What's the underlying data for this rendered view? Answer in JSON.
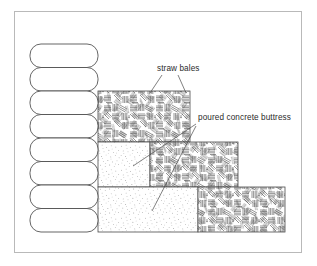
{
  "diagram": {
    "background_color": "#ffffff",
    "frame": {
      "border_color": "#b9b9b9",
      "x": 14,
      "y": 11,
      "width": 288,
      "height": 242
    },
    "labels": [
      {
        "id": "straw-bales",
        "text": "straw bales",
        "x": 157,
        "y": 64,
        "leaders": [
          {
            "x1": 162,
            "y1": 75,
            "x2": 150,
            "y2": 92
          },
          {
            "x1": 178,
            "y1": 75,
            "x2": 186,
            "y2": 92
          }
        ]
      },
      {
        "id": "poured-concrete-buttress",
        "text": "poured concrete buttress",
        "x": 198,
        "y": 113,
        "leaders": [
          {
            "x1": 196,
            "y1": 124,
            "x2": 133,
            "y2": 165
          },
          {
            "x1": 196,
            "y1": 126,
            "x2": 152,
            "y2": 210
          }
        ]
      }
    ],
    "bale_stack": {
      "name": "straw bale wall",
      "count": 8,
      "x": 30,
      "y": 44,
      "width": 68,
      "bale_height": 23.5,
      "corner_radius": 11,
      "stroke_color": "#4a4a4a",
      "fill_color": "#ffffff"
    },
    "buttress_steps": [
      {
        "id": "step-top",
        "material": "straw",
        "texture": "straw-hatch",
        "x": 98,
        "y": 91,
        "width": 92,
        "height": 51
      },
      {
        "id": "step-middle-concrete",
        "material": "concrete",
        "texture": "concrete-stipple",
        "x": 98,
        "y": 142,
        "width": 52,
        "height": 45
      },
      {
        "id": "step-middle-straw",
        "material": "straw",
        "texture": "straw-hatch",
        "x": 150,
        "y": 142,
        "width": 88,
        "height": 45
      },
      {
        "id": "step-bottom-concrete",
        "material": "concrete",
        "texture": "concrete-stipple",
        "x": 98,
        "y": 187,
        "width": 100,
        "height": 45
      },
      {
        "id": "step-bottom-straw",
        "material": "straw",
        "texture": "straw-hatch",
        "x": 198,
        "y": 187,
        "width": 87,
        "height": 45
      }
    ],
    "colors": {
      "line": "#4a4a4a",
      "straw_hatch": "#3c3c3c",
      "concrete_stipple": "#6b6b6b",
      "text": "#2b2b2b",
      "frame": "#b9b9b9"
    }
  }
}
